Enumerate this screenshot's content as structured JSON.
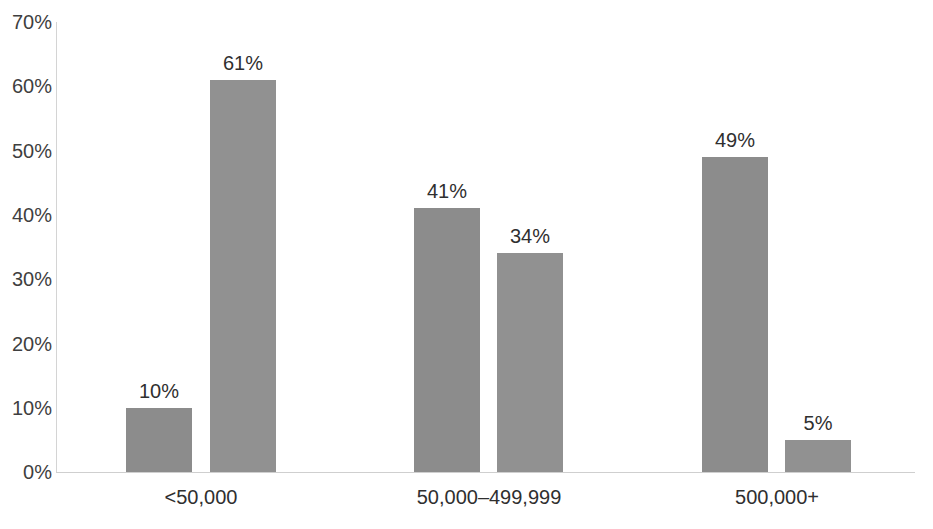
{
  "chart_data": {
    "type": "bar",
    "title": "",
    "subtitle": "",
    "xlabel": "",
    "ylabel": "",
    "ylim": [
      0,
      70
    ],
    "grid": false,
    "legend_position": "none",
    "categories": [
      "<50,000",
      "50,000–499,999",
      "500,000+"
    ],
    "y_ticks": [
      "0%",
      "10%",
      "20%",
      "30%",
      "40%",
      "50%",
      "60%",
      "70%"
    ],
    "y_tick_values": [
      0,
      10,
      20,
      30,
      40,
      50,
      60,
      70
    ],
    "series": [
      {
        "name": "Series 1",
        "values": [
          10,
          41,
          49
        ],
        "value_labels": [
          "10%",
          "41%",
          "49%"
        ],
        "color": "#8c8c8c"
      },
      {
        "name": "Series 2",
        "values": [
          61,
          34,
          5
        ],
        "value_labels": [
          "61%",
          "34%",
          "5%"
        ],
        "color": "#919191"
      }
    ],
    "bars": [
      {
        "category_index": 0,
        "series_index": 0,
        "value": 10,
        "label": "10%"
      },
      {
        "category_index": 0,
        "series_index": 1,
        "value": 61,
        "label": "61%"
      },
      {
        "category_index": 1,
        "series_index": 0,
        "value": 41,
        "label": "41%"
      },
      {
        "category_index": 1,
        "series_index": 1,
        "value": 34,
        "label": "34%"
      },
      {
        "category_index": 2,
        "series_index": 0,
        "value": 49,
        "label": "49%"
      },
      {
        "category_index": 2,
        "series_index": 1,
        "value": 5,
        "label": "5%"
      }
    ]
  },
  "colors": {
    "bar_primary": "#8c8c8c",
    "bar_secondary": "#919191",
    "axis_line": "#cfcfcf",
    "text": "#2f2f2f",
    "tick_text": "#3f3f3f",
    "background": "#ffffff"
  }
}
